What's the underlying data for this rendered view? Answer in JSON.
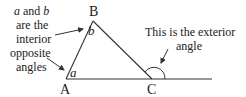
{
  "diagram": {
    "vertices": {
      "A": "A",
      "B": "B",
      "C": "C"
    },
    "angle_labels": {
      "a": "a",
      "b": "b"
    },
    "left_note": {
      "line1_a": "a",
      "line1_mid": " and ",
      "line1_b": "b",
      "line2": "are the",
      "line3": "interior",
      "line4": "opposite",
      "line5": "angles"
    },
    "right_note": {
      "line1": "This is the exterior",
      "line2": "angle"
    },
    "colors": {
      "stroke": "#333333",
      "text": "#222222"
    }
  }
}
